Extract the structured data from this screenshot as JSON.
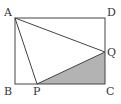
{
  "diagram": {
    "type": "geometry",
    "shape": "rectangle ABCD with points P on BC and Q on CD",
    "points": {
      "A": {
        "label": "A",
        "x": 15,
        "y": 18
      },
      "B": {
        "label": "B",
        "x": 15,
        "y": 84
      },
      "C": {
        "label": "C",
        "x": 105,
        "y": 84
      },
      "D": {
        "label": "D",
        "x": 105,
        "y": 18
      },
      "P": {
        "label": "P",
        "x": 37,
        "y": 84
      },
      "Q": {
        "label": "Q",
        "x": 105,
        "y": 52
      }
    },
    "segments": [
      "AB",
      "BC",
      "CD",
      "DA",
      "AP",
      "AQ",
      "PQ"
    ],
    "shaded_region": {
      "name": "triangle PCQ",
      "color": "#b3b3b3"
    },
    "line_color": "#444444"
  }
}
